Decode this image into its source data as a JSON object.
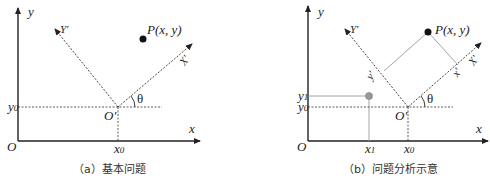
{
  "panels": {
    "a": {
      "caption": "（a）基本问题",
      "labels": {
        "y_axis": "y",
        "x_axis": "x",
        "origin": "O",
        "origin_prime": "O′",
        "y0": "y",
        "y0_sub": "0",
        "x0": "x",
        "x0_sub": "0",
        "Y_prime": "Y′",
        "X_prime": "X′",
        "theta": "θ",
        "point": "P(x, y)"
      }
    },
    "b": {
      "caption": "（b）问题分析示意",
      "labels": {
        "y_axis": "y",
        "x_axis": "x",
        "origin": "O",
        "origin_prime": "O′",
        "y0": "y",
        "y0_sub": "0",
        "y1": "y",
        "y1_sub": "1",
        "x0": "x",
        "x0_sub": "0",
        "x1": "x",
        "x1_sub": "1",
        "Y_prime": "Y′",
        "X_prime": "X′",
        "y_prime_proj": "y′",
        "x_prime_proj": "x′",
        "theta": "θ",
        "point": "P(x, y)"
      }
    }
  },
  "colors": {
    "axis": "#222222",
    "point_primary": "#111111",
    "point_secondary": "#999999",
    "guide_line": "#9a9a9a"
  }
}
